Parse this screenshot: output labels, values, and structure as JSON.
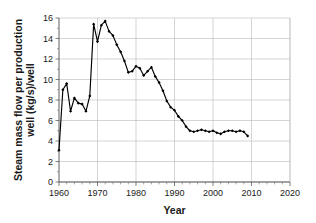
{
  "chart_data": {
    "type": "line",
    "title": "",
    "xlabel": "Year",
    "ylabel": "Steam mass flow per production well (kg/s)/well",
    "ylabel_line1": "Steam mass flow per production",
    "ylabel_line2": "well (kg/s)/well",
    "xlim": [
      1960,
      2020
    ],
    "ylim": [
      0,
      16
    ],
    "xticks": [
      1960,
      1970,
      1980,
      1990,
      2000,
      2010,
      2020
    ],
    "xtick_labels": [
      "1960",
      "1970",
      "1980",
      "1990",
      "2000",
      "2010",
      "2020"
    ],
    "xtick_minor_step": 2,
    "yticks": [
      0,
      2,
      4,
      6,
      8,
      10,
      12,
      14,
      16
    ],
    "ytick_labels": [
      "0",
      "2",
      "4",
      "6",
      "8",
      "10",
      "12",
      "14",
      "16"
    ],
    "grid": "horizontal",
    "legend": "none",
    "marker": "filled-diamond",
    "line_color": "#000000",
    "grid_color": "#b8b8b8",
    "axis_color": "#4d4d4d",
    "series": [
      {
        "name": "Steam mass flow per production well",
        "x": [
          1960,
          1961,
          1962,
          1963,
          1964,
          1965,
          1966,
          1967,
          1968,
          1969,
          1970,
          1971,
          1972,
          1973,
          1974,
          1975,
          1976,
          1977,
          1978,
          1979,
          1980,
          1981,
          1982,
          1983,
          1984,
          1985,
          1986,
          1987,
          1988,
          1989,
          1990,
          1991,
          1992,
          1993,
          1994,
          1995,
          1996,
          1997,
          1998,
          1999,
          2000,
          2001,
          2002,
          2003,
          2004,
          2005,
          2006,
          2007,
          2008,
          2009
        ],
        "values": [
          3.1,
          9.0,
          9.6,
          6.9,
          8.2,
          7.7,
          7.6,
          6.9,
          8.4,
          15.4,
          13.7,
          15.3,
          15.7,
          14.7,
          14.3,
          13.4,
          12.7,
          11.8,
          10.7,
          10.8,
          11.3,
          11.1,
          10.4,
          10.8,
          11.2,
          10.3,
          9.7,
          8.9,
          7.9,
          7.3,
          7.0,
          6.4,
          6.0,
          5.4,
          5.0,
          4.9,
          5.0,
          5.1,
          5.0,
          4.9,
          5.0,
          4.8,
          4.7,
          4.9,
          5.0,
          5.0,
          4.9,
          5.0,
          4.9,
          4.5
        ]
      }
    ]
  }
}
